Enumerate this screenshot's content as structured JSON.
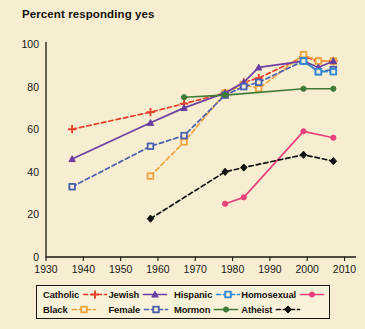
{
  "chart_data": {
    "type": "line",
    "title": "Percent responding yes",
    "xlabel": "",
    "ylabel": "",
    "xlim": [
      1930,
      2012
    ],
    "ylim": [
      0,
      100
    ],
    "yticks": [
      0,
      20,
      40,
      60,
      80,
      100
    ],
    "xticks": [
      1930,
      1940,
      1950,
      1960,
      1970,
      1980,
      1990,
      2000,
      2010
    ],
    "grid": false,
    "legend_position": "below-axes",
    "series": [
      {
        "name": "Catholic",
        "color": "#e8402a",
        "line_style": "dashed",
        "marker": "plus",
        "x": [
          1937,
          1958,
          1967,
          1978,
          1983,
          1987,
          1999,
          2003,
          2007
        ],
        "values": [
          60,
          68,
          72,
          77,
          82,
          84,
          94,
          92,
          92
        ]
      },
      {
        "name": "Black",
        "color": "#f0a33c",
        "line_style": "dashed",
        "marker": "square",
        "x": [
          1958,
          1967,
          1978,
          1983,
          1987,
          1999,
          2003,
          2007
        ],
        "values": [
          38,
          54,
          77,
          81,
          79,
          95,
          92,
          92
        ]
      },
      {
        "name": "Jewish",
        "color": "#6b3fa0",
        "line_style": "solid",
        "marker": "triangle",
        "x": [
          1937,
          1958,
          1967,
          1978,
          1983,
          1987,
          1999,
          2003,
          2007
        ],
        "values": [
          46,
          63,
          70,
          77,
          82,
          89,
          92,
          89,
          92
        ]
      },
      {
        "name": "Female",
        "color": "#4a5fb0",
        "line_style": "dashed",
        "marker": "square",
        "x": [
          1937,
          1958,
          1967,
          1978,
          1983,
          1987,
          1999,
          2003,
          2007
        ],
        "values": [
          33,
          52,
          57,
          76,
          80,
          82,
          92,
          87,
          88
        ]
      },
      {
        "name": "Hispanic",
        "color": "#2e8ad8",
        "line_style": "dashed",
        "marker": "square",
        "x": [
          1999,
          2003,
          2007
        ],
        "values": [
          92,
          87,
          87
        ]
      },
      {
        "name": "Mormon",
        "color": "#3f7a36",
        "line_style": "solid",
        "marker": "circle",
        "x": [
          1967,
          1978,
          1999,
          2007
        ],
        "values": [
          75,
          76,
          79,
          79
        ]
      },
      {
        "name": "Homosexual",
        "color": "#e8427c",
        "line_style": "solid",
        "marker": "circle",
        "x": [
          1978,
          1983,
          1999,
          2007
        ],
        "values": [
          25,
          28,
          59,
          56
        ]
      },
      {
        "name": "Atheist",
        "color": "#111111",
        "line_style": "dashed",
        "marker": "diamond",
        "x": [
          1958,
          1978,
          1983,
          1999,
          2007
        ],
        "values": [
          18,
          40,
          42,
          48,
          45
        ]
      }
    ]
  },
  "legend": {
    "entries": [
      {
        "label": "Catholic"
      },
      {
        "label": "Jewish"
      },
      {
        "label": "Hispanic"
      },
      {
        "label": "Homosexual"
      },
      {
        "label": "Black"
      },
      {
        "label": "Female"
      },
      {
        "label": "Mormon"
      },
      {
        "label": "Atheist"
      }
    ]
  }
}
